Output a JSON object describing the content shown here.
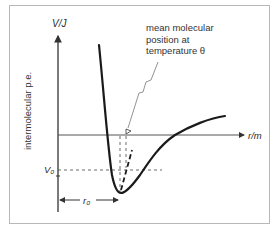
{
  "diagram": {
    "y_axis_label": "V/J",
    "y_axis_side_label": "intermolecular p.e.",
    "x_axis_label": "r/m",
    "v0_label": "V₀",
    "r0_label": "r₀",
    "annotation": {
      "line1": "mean molecular",
      "line2": "position at",
      "line3": "temperature θ"
    },
    "colors": {
      "curve": "#1a1a1a",
      "axes": "#333333",
      "dashed": "#444444",
      "frame": "#b8b8b8",
      "text": "#2a2a2a"
    }
  }
}
